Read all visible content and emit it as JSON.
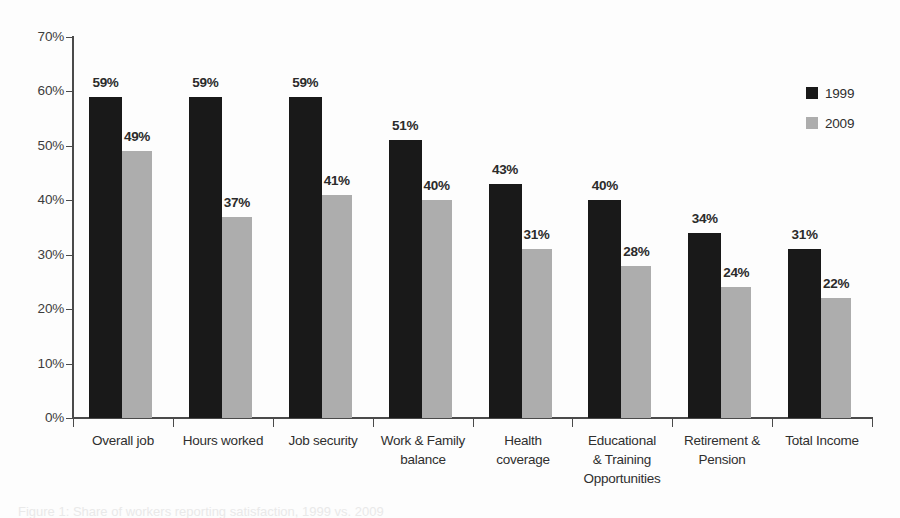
{
  "chart_data": {
    "type": "bar",
    "title": "",
    "xlabel": "",
    "ylabel": "",
    "ylim": [
      0,
      70
    ],
    "y_tick_labels": [
      "70%",
      "60%",
      "50%",
      "40%",
      "30%",
      "20%",
      "10%",
      "0%"
    ],
    "y_tick_values": [
      70,
      60,
      50,
      40,
      30,
      20,
      10,
      0
    ],
    "grid": false,
    "legend_position": "top-right",
    "categories": [
      "Overall job",
      "Hours worked",
      "Job security",
      "Work & Family balance",
      "Health coverage",
      "Educational & Training Opportunities",
      "Retirement & Pension",
      "Total Income"
    ],
    "category_lines": [
      [
        "Overall job"
      ],
      [
        "Hours worked"
      ],
      [
        "Job security"
      ],
      [
        "Work & Family",
        "balance"
      ],
      [
        "Health",
        "coverage"
      ],
      [
        "Educational",
        "& Training",
        "Opportunities"
      ],
      [
        "Retirement &",
        "Pension"
      ],
      [
        "Total Income"
      ]
    ],
    "series": [
      {
        "name": "1999",
        "color": "#191919",
        "values": [
          59,
          59,
          59,
          51,
          43,
          40,
          34,
          31
        ],
        "labels": [
          "59%",
          "59%",
          "59%",
          "51%",
          "43%",
          "40%",
          "34%",
          "31%"
        ]
      },
      {
        "name": "2009",
        "color": "#adadad",
        "values": [
          49,
          37,
          41,
          40,
          31,
          28,
          24,
          22
        ],
        "labels": [
          "49%",
          "37%",
          "41%",
          "40%",
          "31%",
          "28%",
          "24%",
          "22%"
        ]
      }
    ]
  },
  "legend": {
    "entries": [
      {
        "label": "1999",
        "color": "#191919"
      },
      {
        "label": "2009",
        "color": "#adadad"
      }
    ]
  },
  "caption": {
    "cut_off_text": "Figure 1: Share of workers reporting satisfaction, 1999 vs. 2009"
  }
}
